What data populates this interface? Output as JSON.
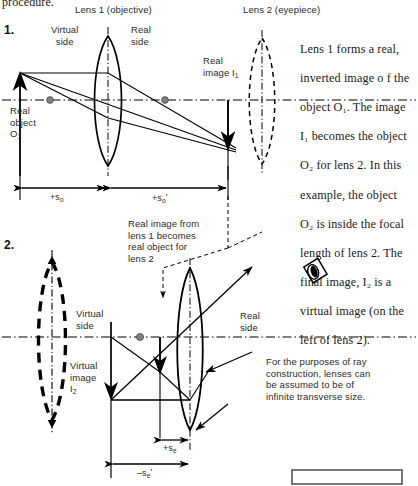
{
  "page": {
    "top_cut_text": "procedure."
  },
  "headings": {
    "lens1": "Lens 1 (objective)",
    "lens2": "Lens 2 (eyepiece)"
  },
  "sections": {
    "one": {
      "number": "1.",
      "virtual_side": "Virtual\nside",
      "real_side": "Real\nside",
      "real_object": "Real\nobject",
      "real_object_sub": "O",
      "real_object_subnum": "1",
      "real_image": "Real\nimage I",
      "real_image_subnum": "1",
      "dim_so": "+s",
      "dim_so_sub": "o",
      "dim_sop": "+s",
      "dim_sop_sub": "o",
      "dim_sop_prime": "'"
    },
    "two": {
      "number": "2.",
      "virtual_side": "Virtual\nside",
      "real_side": "Real\nside",
      "virtual_image": "Virtual\nimage",
      "virtual_image_sub": "I",
      "virtual_image_subnum": "2",
      "callout_real_image": "Real image from\nlens 1 becomes\nreal object for\nlens 2",
      "callout_infinite": "For the purposes of ray\nconstruction, lenses can\nbe assumed to be of\ninfinite transverse size.",
      "dim_se": "+s",
      "dim_se_sub": "e",
      "dim_sep": "–s",
      "dim_sep_sub": "e",
      "dim_sep_prime": "'"
    }
  },
  "body_text": {
    "paragraph_lines": [
      "Lens 1 forms a real,",
      "inverted image o f the",
      "object O₁. The image",
      "I₁ becomes the object",
      "O₂ for lens 2. In this",
      "example, the object",
      "O₂ is inside the focal",
      "length of lens 2. The",
      "final image, I₂ is a",
      "virtual image (on the",
      "left of lens 2)."
    ]
  },
  "icons": {
    "eye": "eye-icon"
  },
  "colors": {
    "ink": "#1a1a1a",
    "line": "#000000",
    "focal_dot": "#808080",
    "text": "#2b2b2b"
  }
}
